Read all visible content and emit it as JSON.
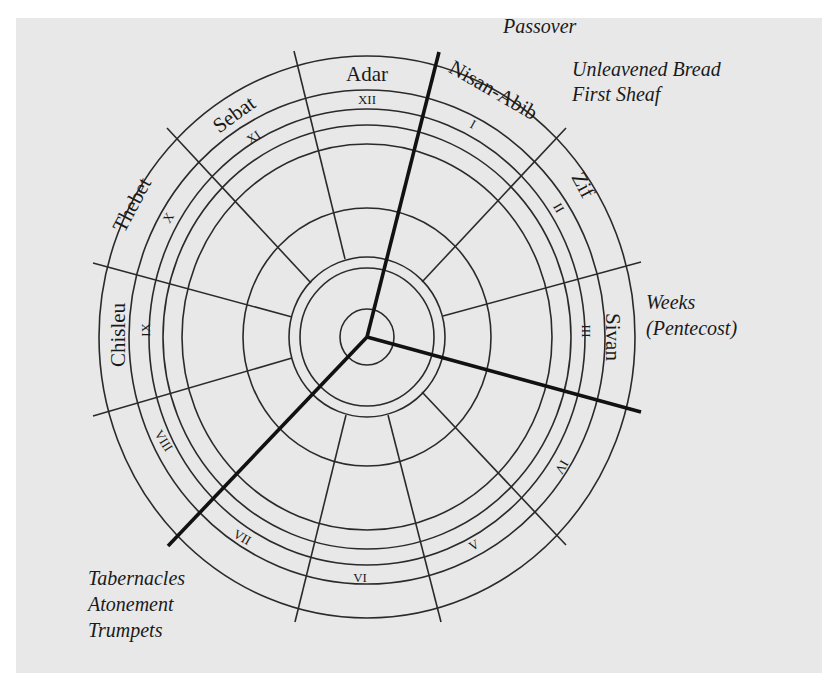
{
  "diagram": {
    "type": "circular-calendar",
    "background_color": "#e8e8e8",
    "months": [
      {
        "name": "Nisan-Abib",
        "number": "I"
      },
      {
        "name": "Zif",
        "number": "II"
      },
      {
        "name": "Sivan",
        "number": "III"
      },
      {
        "name": "",
        "number": "IV"
      },
      {
        "name": "",
        "number": "V"
      },
      {
        "name": "",
        "number": "VI"
      },
      {
        "name": "",
        "number": "VII"
      },
      {
        "name": "",
        "number": "VIII"
      },
      {
        "name": "Chisleu",
        "number": "IX"
      },
      {
        "name": "Thebet",
        "number": "X"
      },
      {
        "name": "Sebat",
        "number": "XI"
      },
      {
        "name": "Adar",
        "number": "XII"
      }
    ],
    "feasts": {
      "spring": [
        "Passover",
        "Unleavened Bread",
        "First Sheaf"
      ],
      "summer": [
        "Weeks",
        "(Pentecost)"
      ],
      "autumn": [
        "Tabernacles",
        "Atonement",
        "Trumpets"
      ]
    }
  }
}
